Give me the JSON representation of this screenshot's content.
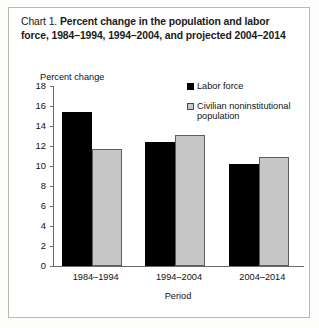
{
  "panel": {
    "background": "#ffffff",
    "border_color": "#b9b9b4"
  },
  "title": {
    "label": "Chart 1.",
    "text": "Percent change in the population and labor force, 1984–1994, 1994–2004, and projected 2004–2014"
  },
  "legend": {
    "position": "top-right",
    "items": [
      {
        "name": "Labor force",
        "color": "#000000"
      },
      {
        "name": "Civilian noninstitutional population",
        "color": "#c6c6c6"
      }
    ]
  },
  "axes": {
    "ylabel": "Percent change",
    "xlabel": "Period",
    "yticks": [
      18,
      16,
      14,
      12,
      10,
      8,
      6,
      4,
      2,
      0
    ]
  },
  "chart_data": {
    "type": "bar",
    "title": "Chart 1. Percent change in the population and labor force, 1984–1994, 1994–2004, and projected 2004–2014",
    "xlabel": "Period",
    "ylabel": "Percent change",
    "ylim": [
      0,
      18
    ],
    "ytick_step": 2,
    "grid": false,
    "legend_position": "top-right",
    "categories": [
      "1984–1994",
      "1994–2004",
      "2004–2014"
    ],
    "series": [
      {
        "name": "Labor force",
        "color": "#000000",
        "values": [
          15.4,
          12.4,
          10.2
        ]
      },
      {
        "name": "Civilian noninstitutional population",
        "color": "#c6c6c6",
        "values": [
          11.7,
          13.1,
          10.9
        ]
      }
    ]
  }
}
